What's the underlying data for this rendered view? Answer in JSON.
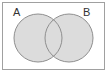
{
  "diagram": {
    "type": "venn",
    "universe": {
      "label": ""
    },
    "sets": [
      {
        "label": "A",
        "fill": "#dcdcdc",
        "stroke": "#8f8f8f"
      },
      {
        "label": "B",
        "fill": "#dcdcdc",
        "stroke": "#8f8f8f"
      }
    ],
    "border_color": "#a0a0a0",
    "shaded_region": "A ∪ B"
  }
}
